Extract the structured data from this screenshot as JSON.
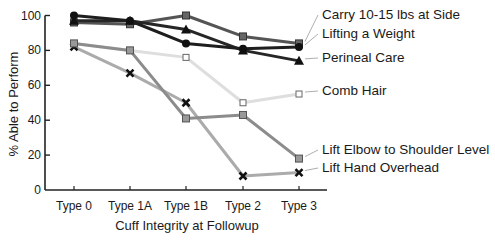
{
  "chart_data": {
    "type": "line",
    "title": "",
    "xlabel": "Cuff Integrity at Followup",
    "ylabel": "% Able to Perform",
    "ylim": [
      0,
      100
    ],
    "yticks": [
      0,
      20,
      40,
      60,
      80,
      100
    ],
    "grid": false,
    "legend_position": "right (direct labels)",
    "categories": [
      "Type 0",
      "Type 1A",
      "Type 1B",
      "Type 2",
      "Type 3"
    ],
    "series": [
      {
        "name": "Carry 10-15 lbs at Side",
        "marker": "filled-square",
        "color": "#555555",
        "values": [
          96,
          95,
          100,
          88,
          84
        ]
      },
      {
        "name": "Lifting a Weight",
        "marker": "circle",
        "color": "#1e1e1e",
        "values": [
          100,
          97,
          84,
          81,
          82
        ]
      },
      {
        "name": "Perineal Care",
        "marker": "triangle",
        "color": "#262626",
        "values": [
          97,
          97,
          92,
          80,
          74
        ]
      },
      {
        "name": "Comb Hair",
        "marker": "open-square",
        "color": "#dedede",
        "values": [
          84,
          80,
          76,
          50,
          55
        ]
      },
      {
        "name": "Lift Elbow to Shoulder Level",
        "marker": "grey-square",
        "color": "#8c8c8c",
        "values": [
          84,
          80,
          41,
          43,
          18
        ]
      },
      {
        "name": "Lift Hand Overhead",
        "marker": "x",
        "color": "#ababab",
        "values": [
          82,
          67,
          50,
          8,
          10
        ]
      }
    ]
  }
}
